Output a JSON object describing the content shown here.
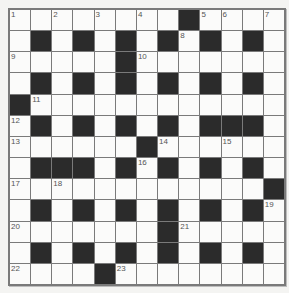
{
  "puzzle": {
    "type": "crossword",
    "rows": 13,
    "cols": 13,
    "colors": {
      "black": "#2b2b2b",
      "white": "#fbfbfa",
      "border": "#7a7a7a",
      "number": "#555555"
    },
    "grid": [
      "........#....",
      ".#.#.#.#.#.#.",
      ".....#.......",
      ".#.#.#.#.#.#.",
      "#............",
      ".#.#.#.#.###.",
      "......#......",
      ".###.#.#.#.#.",
      "............#",
      ".#.#.#.#.#.#.",
      ".......#.....",
      ".#.#.#.#.#.#.",
      "....#........"
    ],
    "numbers": [
      {
        "r": 0,
        "c": 0,
        "n": "1"
      },
      {
        "r": 0,
        "c": 2,
        "n": "2"
      },
      {
        "r": 0,
        "c": 4,
        "n": "3"
      },
      {
        "r": 0,
        "c": 6,
        "n": "4"
      },
      {
        "r": 0,
        "c": 9,
        "n": "5"
      },
      {
        "r": 0,
        "c": 10,
        "n": "6"
      },
      {
        "r": 0,
        "c": 12,
        "n": "7"
      },
      {
        "r": 1,
        "c": 8,
        "n": "8"
      },
      {
        "r": 2,
        "c": 0,
        "n": "9"
      },
      {
        "r": 2,
        "c": 6,
        "n": "10"
      },
      {
        "r": 4,
        "c": 1,
        "n": "11"
      },
      {
        "r": 5,
        "c": 0,
        "n": "12"
      },
      {
        "r": 6,
        "c": 0,
        "n": "13"
      },
      {
        "r": 6,
        "c": 7,
        "n": "14"
      },
      {
        "r": 6,
        "c": 10,
        "n": "15"
      },
      {
        "r": 7,
        "c": 6,
        "n": "16"
      },
      {
        "r": 8,
        "c": 0,
        "n": "17"
      },
      {
        "r": 8,
        "c": 2,
        "n": "18"
      },
      {
        "r": 9,
        "c": 12,
        "n": "19"
      },
      {
        "r": 10,
        "c": 0,
        "n": "20"
      },
      {
        "r": 10,
        "c": 8,
        "n": "21"
      },
      {
        "r": 12,
        "c": 0,
        "n": "22"
      },
      {
        "r": 12,
        "c": 5,
        "n": "23"
      }
    ]
  }
}
